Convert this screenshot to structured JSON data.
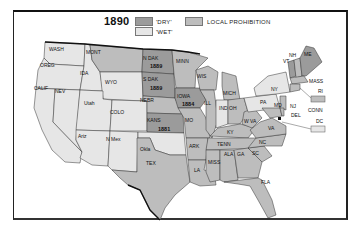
{
  "map": {
    "year": "1890",
    "legend": [
      {
        "key": "dry",
        "label": "'DRY'",
        "color": "#9b9b9b"
      },
      {
        "key": "wet",
        "label": "'WET'",
        "color": "#e6e6e6"
      },
      {
        "key": "local",
        "label": "LOCAL PROHIBITION",
        "color": "#bdbdbd"
      }
    ],
    "colors": {
      "dry": "#9b9b9b",
      "wet": "#e6e6e6",
      "local": "#bdbdbd",
      "water": "#ffffff",
      "border": "#333333"
    },
    "states": [
      {
        "abbr": "WASH",
        "status": "wet"
      },
      {
        "abbr": "OREG",
        "status": "wet"
      },
      {
        "abbr": "CALIF",
        "status": "wet"
      },
      {
        "abbr": "NEV",
        "status": "wet"
      },
      {
        "abbr": "IDA",
        "status": "wet"
      },
      {
        "abbr": "MONT",
        "status": "local"
      },
      {
        "abbr": "WYO",
        "status": "wet"
      },
      {
        "abbr": "Utah",
        "status": "wet"
      },
      {
        "abbr": "COLO",
        "status": "wet"
      },
      {
        "abbr": "Ariz",
        "status": "wet"
      },
      {
        "abbr": "N Mex",
        "status": "wet"
      },
      {
        "abbr": "N DAK",
        "status": "dry",
        "year": "1889"
      },
      {
        "abbr": "S DAK",
        "status": "dry",
        "year": "1889"
      },
      {
        "abbr": "NEBR",
        "status": "local"
      },
      {
        "abbr": "KANS",
        "status": "dry",
        "year": "1881"
      },
      {
        "abbr": "Okla",
        "status": "wet"
      },
      {
        "abbr": "TEX",
        "status": "local"
      },
      {
        "abbr": "MINN",
        "status": "local"
      },
      {
        "abbr": "IOWA",
        "status": "dry",
        "year": "1884"
      },
      {
        "abbr": "MO",
        "status": "local"
      },
      {
        "abbr": "ARK",
        "status": "local"
      },
      {
        "abbr": "LA",
        "status": "local"
      },
      {
        "abbr": "WIS",
        "status": "local"
      },
      {
        "abbr": "ILL",
        "status": "local"
      },
      {
        "abbr": "MICH",
        "status": "local"
      },
      {
        "abbr": "IND",
        "status": "wet"
      },
      {
        "abbr": "OH",
        "status": "local"
      },
      {
        "abbr": "KY",
        "status": "local"
      },
      {
        "abbr": "TENN",
        "status": "local"
      },
      {
        "abbr": "MISS",
        "status": "local"
      },
      {
        "abbr": "ALA",
        "status": "local"
      },
      {
        "abbr": "GA",
        "status": "local"
      },
      {
        "abbr": "FLA",
        "status": "local"
      },
      {
        "abbr": "SC",
        "status": "local"
      },
      {
        "abbr": "NC",
        "status": "local"
      },
      {
        "abbr": "VA",
        "status": "local"
      },
      {
        "abbr": "W VA",
        "status": "local"
      },
      {
        "abbr": "PA",
        "status": "local"
      },
      {
        "abbr": "NY",
        "status": "local"
      },
      {
        "abbr": "VT",
        "status": "dry"
      },
      {
        "abbr": "NH",
        "status": "local"
      },
      {
        "abbr": "ME",
        "status": "dry"
      },
      {
        "abbr": "MASS",
        "status": "local"
      },
      {
        "abbr": "RI",
        "status": "local"
      },
      {
        "abbr": "CONN",
        "status": "local"
      },
      {
        "abbr": "NJ",
        "status": "local"
      },
      {
        "abbr": "DEL",
        "status": "local"
      },
      {
        "abbr": "MD",
        "status": "local"
      },
      {
        "abbr": "DC",
        "status": "wet"
      }
    ]
  },
  "labels": {
    "WASH": "WASH",
    "OREG": "OREG",
    "CALIF": "CALIF",
    "NEV": "NEV",
    "IDA": "IDA",
    "MONT": "MONT",
    "WYO": "WYO",
    "Utah": "Utah",
    "COLO": "COLO",
    "Ariz": "Ariz",
    "NMex": "N Mex",
    "NDAK": "N DAK",
    "NDAK_year": "1889",
    "SDAK": "S DAK",
    "SDAK_year": "1889",
    "NEBR": "NEBR",
    "KANS": "KANS",
    "KANS_year": "1881",
    "Okla": "Okla",
    "TEX": "TEX",
    "MINN": "MINN",
    "IOWA": "IOWA",
    "IOWA_year": "1884",
    "MO": "MO",
    "ARK": "ARK",
    "LA": "LA",
    "WIS": "WIS",
    "ILL": "ILL",
    "MICH": "MICH",
    "IND": "IND",
    "OH": "OH",
    "KY": "KY",
    "TENN": "TENN",
    "MISS": "MISS",
    "ALA": "ALA",
    "GA": "GA",
    "FLA": "FLA",
    "SC": "SC",
    "NC": "NC",
    "VA": "VA",
    "WVA": "W VA",
    "PA": "PA",
    "NY": "NY",
    "VT": "VT",
    "NH": "NH",
    "ME": "ME",
    "MASS": "MASS",
    "RI": "RI",
    "CONN": "CONN",
    "NJ": "NJ",
    "DEL": "DEL",
    "MD": "MD",
    "DC": "DC"
  }
}
